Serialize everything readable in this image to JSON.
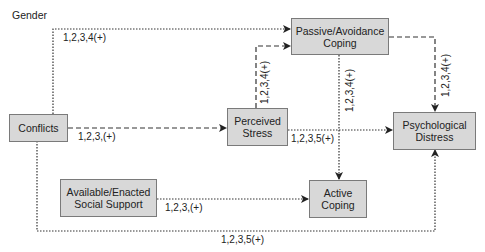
{
  "diagram": {
    "moderator_label": "Gender",
    "nodes": {
      "conflicts": "Conflicts",
      "passive_coping": "Passive/Avoidance\nCoping",
      "perceived_stress": "Perceived\nStress",
      "psych_distress": "Psychological\nDistress",
      "social_support": "Available/Enacted\nSocial Support",
      "active_coping": "Active\nCoping"
    },
    "edges": [
      {
        "from": "Conflicts",
        "to": "Passive/Avoidance Coping",
        "label": "1,2,3,4(+)",
        "style": "dotted"
      },
      {
        "from": "Conflicts",
        "to": "Perceived Stress",
        "label": "1,2,3,(+)",
        "style": "dashed"
      },
      {
        "from": "Perceived Stress",
        "to": "Passive/Avoidance Coping",
        "label": "1,2,3,4(+)",
        "style": "dashed"
      },
      {
        "from": "Passive/Avoidance Coping",
        "to": "Psychological Distress",
        "label": "1,2,3,4(+)",
        "style": "dashed"
      },
      {
        "from": "Passive/Avoidance Coping",
        "to": "Active Coping",
        "label": "1,2,3,4(+)",
        "style": "dotted"
      },
      {
        "from": "Perceived Stress",
        "to": "Psychological Distress",
        "label": "1,2,3,5(+)",
        "style": "dotted"
      },
      {
        "from": "Available/Enacted Social Support",
        "to": "Active Coping",
        "label": "1,2,3,(+)",
        "style": "dotted"
      },
      {
        "from": "Conflicts",
        "to": "Psychological Distress",
        "label": "1,2,3,5(+)",
        "style": "dotted"
      }
    ],
    "labels": {
      "conf_passive": "1,2,3,4(+)",
      "conf_stress": "1,2,3,(+)",
      "stress_passive": "1,2,3,4(+)",
      "passive_distress": "1,2,3,4(+)",
      "passive_active": "1,2,3,4(+)",
      "stress_distress": "1,2,3,5(+)",
      "support_active": "1,2,3,(+)",
      "conf_distress": "1,2,3,5(+)"
    }
  }
}
